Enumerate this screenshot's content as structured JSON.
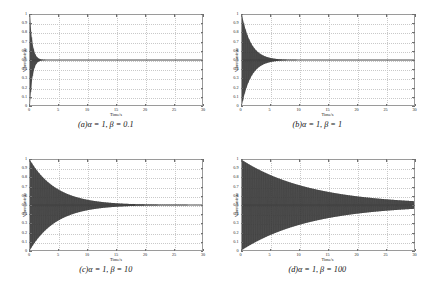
{
  "figure": {
    "panel_count": 4,
    "trace_color": "#3a3a3a",
    "grid_color": "#c9c9c9",
    "axis_color": "#9a9a9a",
    "background": "#ffffff"
  },
  "axis": {
    "xlabel": "Time/s",
    "ylabel": "Vibration/mm",
    "xticks": [
      "0",
      "5",
      "10",
      "15",
      "20",
      "25",
      "30"
    ],
    "xtick_values": [
      0,
      5,
      10,
      15,
      20,
      25,
      30
    ],
    "yticks": [
      "0",
      "0.1",
      "0.2",
      "0.3",
      "0.4",
      "0.5",
      "0.6",
      "0.7",
      "0.8",
      "0.9",
      "1"
    ],
    "ytick_values": [
      0,
      0.1,
      0.2,
      0.3,
      0.4,
      0.5,
      0.6,
      0.7,
      0.8,
      0.9,
      1
    ],
    "xlim": [
      0,
      30
    ],
    "ylim": [
      0,
      1
    ]
  },
  "panels": [
    {
      "key": "a",
      "caption_prefix": "(",
      "caption_label": "a",
      "caption_suffix": ")",
      "caption_alpha": "α = 1",
      "caption_sep": ", ",
      "caption_beta": "β = 0.1",
      "alpha": 1,
      "beta": 0.1,
      "decay_rate": 2.2,
      "oscillation_hz": 3.2,
      "amplitude0": 0.5,
      "offset": 0.5
    },
    {
      "key": "b",
      "caption_prefix": "(",
      "caption_label": "b",
      "caption_suffix": ")",
      "caption_alpha": "α = 1",
      "caption_sep": ", ",
      "caption_beta": "β = 1",
      "alpha": 1,
      "beta": 1,
      "decay_rate": 0.62,
      "oscillation_hz": 3.2,
      "amplitude0": 0.5,
      "offset": 0.5
    },
    {
      "key": "c",
      "caption_prefix": "(",
      "caption_label": "c",
      "caption_suffix": ")",
      "caption_alpha": "α = 1",
      "caption_sep": ", ",
      "caption_beta": "β = 10",
      "alpha": 1,
      "beta": 10,
      "decay_rate": 0.215,
      "oscillation_hz": 3.2,
      "amplitude0": 0.5,
      "offset": 0.5
    },
    {
      "key": "d",
      "caption_prefix": "(",
      "caption_label": "d",
      "caption_suffix": ")",
      "caption_alpha": "α = 1",
      "caption_sep": ", ",
      "caption_beta": "β = 100",
      "alpha": 1,
      "beta": 100,
      "decay_rate": 0.082,
      "oscillation_hz": 3.2,
      "amplitude0": 0.5,
      "offset": 0.5
    }
  ],
  "chart_data": {
    "type": "line",
    "title": "",
    "subtitle": "",
    "xlabel": "Time/s",
    "ylabel": "Vibration/mm",
    "xlim": [
      0,
      30
    ],
    "ylim": [
      0,
      1
    ],
    "grid": true,
    "legend": "none",
    "panels": [
      {
        "label": "(a) alpha = 1, beta = 0.1",
        "alpha": 1,
        "beta": 0.1,
        "steady_state": 0.5,
        "initial_peak": 1.0,
        "initial_trough": 0.0,
        "settling_time_s": 3,
        "envelope_upper": [
          {
            "t": 0,
            "y": 1.0
          },
          {
            "t": 0.5,
            "y": 0.67
          },
          {
            "t": 1,
            "y": 0.555
          },
          {
            "t": 1.5,
            "y": 0.518
          },
          {
            "t": 2,
            "y": 0.506
          },
          {
            "t": 2.5,
            "y": 0.502
          },
          {
            "t": 3,
            "y": 0.5
          },
          {
            "t": 30,
            "y": 0.5
          }
        ],
        "envelope_lower": [
          {
            "t": 0,
            "y": 0.0
          },
          {
            "t": 0.5,
            "y": 0.33
          },
          {
            "t": 1,
            "y": 0.445
          },
          {
            "t": 1.5,
            "y": 0.482
          },
          {
            "t": 2,
            "y": 0.494
          },
          {
            "t": 2.5,
            "y": 0.498
          },
          {
            "t": 3,
            "y": 0.5
          },
          {
            "t": 30,
            "y": 0.5
          }
        ]
      },
      {
        "label": "(b) alpha = 1, beta = 1",
        "alpha": 1,
        "beta": 1,
        "steady_state": 0.5,
        "initial_peak": 1.0,
        "initial_trough": 0.0,
        "settling_time_s": 9,
        "envelope_upper": [
          {
            "t": 0,
            "y": 1.0
          },
          {
            "t": 2,
            "y": 0.645
          },
          {
            "t": 4,
            "y": 0.542
          },
          {
            "t": 6,
            "y": 0.512
          },
          {
            "t": 8,
            "y": 0.504
          },
          {
            "t": 9,
            "y": 0.502
          },
          {
            "t": 12,
            "y": 0.5
          },
          {
            "t": 30,
            "y": 0.5
          }
        ],
        "envelope_lower": [
          {
            "t": 0,
            "y": 0.0
          },
          {
            "t": 2,
            "y": 0.355
          },
          {
            "t": 4,
            "y": 0.458
          },
          {
            "t": 6,
            "y": 0.488
          },
          {
            "t": 8,
            "y": 0.496
          },
          {
            "t": 9,
            "y": 0.498
          },
          {
            "t": 12,
            "y": 0.5
          },
          {
            "t": 30,
            "y": 0.5
          }
        ]
      },
      {
        "label": "(c) alpha = 1, beta = 10",
        "alpha": 1,
        "beta": 10,
        "steady_state": 0.5,
        "initial_peak": 1.0,
        "initial_trough": 0.0,
        "settling_time_s": 20,
        "envelope_upper": [
          {
            "t": 0,
            "y": 1.0
          },
          {
            "t": 5,
            "y": 0.671
          },
          {
            "t": 10,
            "y": 0.558
          },
          {
            "t": 15,
            "y": 0.52
          },
          {
            "t": 20,
            "y": 0.507
          },
          {
            "t": 25,
            "y": 0.502
          },
          {
            "t": 30,
            "y": 0.501
          }
        ],
        "envelope_lower": [
          {
            "t": 0,
            "y": 0.0
          },
          {
            "t": 5,
            "y": 0.329
          },
          {
            "t": 10,
            "y": 0.442
          },
          {
            "t": 15,
            "y": 0.48
          },
          {
            "t": 20,
            "y": 0.493
          },
          {
            "t": 25,
            "y": 0.498
          },
          {
            "t": 30,
            "y": 0.499
          }
        ]
      },
      {
        "label": "(d) alpha = 1, beta = 100",
        "alpha": 1,
        "beta": 100,
        "steady_state": 0.5,
        "initial_peak": 1.0,
        "initial_trough": 0.0,
        "settling_time_s": 30,
        "envelope_upper": [
          {
            "t": 0,
            "y": 1.0
          },
          {
            "t": 5,
            "y": 0.832
          },
          {
            "t": 10,
            "y": 0.72
          },
          {
            "t": 15,
            "y": 0.646
          },
          {
            "t": 20,
            "y": 0.597
          },
          {
            "t": 25,
            "y": 0.565
          },
          {
            "t": 30,
            "y": 0.543
          }
        ],
        "envelope_lower": [
          {
            "t": 0,
            "y": 0.0
          },
          {
            "t": 5,
            "y": 0.168
          },
          {
            "t": 10,
            "y": 0.28
          },
          {
            "t": 15,
            "y": 0.354
          },
          {
            "t": 20,
            "y": 0.403
          },
          {
            "t": 25,
            "y": 0.435
          },
          {
            "t": 30,
            "y": 0.457
          }
        ]
      }
    ]
  }
}
